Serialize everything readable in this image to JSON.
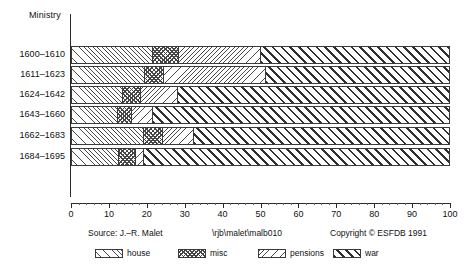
{
  "chart_data": {
    "type": "bar",
    "orientation": "horizontal",
    "stacked": true,
    "title": "",
    "ylabel": "Ministry",
    "xlabel": "",
    "xlim": [
      0,
      100
    ],
    "grid": false,
    "legend_position": "bottom",
    "categories": [
      "1600–1610",
      "1611–1623",
      "1624–1642",
      "1643–1660",
      "1662–1683",
      "1684–1695"
    ],
    "series": [
      {
        "name": "house",
        "values": [
          21.4,
          19.3,
          13.5,
          12.1,
          19.0,
          12.4
        ]
      },
      {
        "name": "misc",
        "values": [
          6.8,
          5.0,
          4.7,
          3.7,
          5.0,
          4.5
        ]
      },
      {
        "name": "pensions",
        "values": [
          21.7,
          26.9,
          9.8,
          5.6,
          8.2,
          2.1
        ]
      },
      {
        "name": "war",
        "values": [
          50.1,
          48.8,
          72.0,
          78.6,
          67.8,
          81.0
        ]
      }
    ],
    "xticks": [
      0,
      10,
      20,
      30,
      40,
      50,
      60,
      70,
      80,
      90,
      100
    ],
    "xtick_labels": [
      "0",
      "10",
      "20",
      "30",
      "40",
      "50",
      "60",
      "70",
      "80",
      "90",
      "100"
    ],
    "minor_tick_step": 2
  },
  "axes": {
    "y_axis_title": "Ministry"
  },
  "legend": {
    "items": [
      {
        "label": "house",
        "pattern": "fine-forward-hatch"
      },
      {
        "label": "misc",
        "pattern": "cross-checker"
      },
      {
        "label": "pensions",
        "pattern": "fine-backward-hatch"
      },
      {
        "label": "war",
        "pattern": "bold-forward-hatch"
      }
    ]
  },
  "footer": {
    "source": "Source: J.–R. Malet",
    "path": "\\rjb\\malet\\malb010",
    "copyright": "Copyright © ESFDB 1991"
  },
  "colors": {
    "ink": "#1a1a1a",
    "hatch": "#4a4a4a",
    "war_hatch": "#2f2f2f",
    "background": "#ffffff"
  }
}
